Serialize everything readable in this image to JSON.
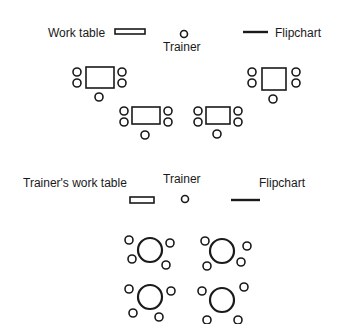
{
  "layout_top": {
    "labels": {
      "work_table": "Work table",
      "trainer": "Trainer",
      "flipchart": "Flipchart"
    }
  },
  "layout_bottom": {
    "labels": {
      "work_table": "Trainer's work table",
      "trainer": "Trainer",
      "flipchart": "Flipchart"
    }
  },
  "colors": {
    "stroke": "#1a1a1a",
    "background": "#ffffff"
  }
}
